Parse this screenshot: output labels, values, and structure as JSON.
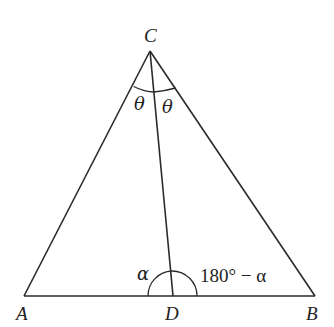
{
  "diagram": {
    "type": "triangle-angle-bisector",
    "vertices": {
      "A": {
        "label": "A",
        "x": 24,
        "y": 296
      },
      "B": {
        "label": "B",
        "x": 315,
        "y": 296
      },
      "C": {
        "label": "C",
        "x": 150,
        "y": 51
      },
      "D": {
        "label": "D",
        "x": 173,
        "y": 296
      }
    },
    "segments": [
      "AB",
      "AC",
      "BC",
      "CD"
    ],
    "angle_labels": {
      "theta_left": "θ",
      "theta_right": "θ",
      "alpha": "α",
      "supplement": "180° − α"
    },
    "colors": {
      "line": "#2a2a2a",
      "text": "#222222",
      "background": "#ffffff"
    }
  }
}
